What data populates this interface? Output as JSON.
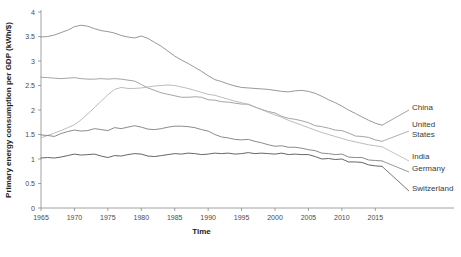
{
  "chart_data": {
    "type": "line",
    "title": "",
    "xlabel": "Time",
    "ylabel": "Primary energy consumption per GDP (kWh/$)",
    "xlim": [
      1965,
      2016
    ],
    "ylim": [
      0,
      4
    ],
    "grid": false,
    "legend_position": "right-inline-labels",
    "xticks": [
      "1965",
      "1970",
      "1975",
      "1980",
      "1985",
      "1990",
      "1995",
      "2000",
      "2005",
      "2010",
      "2015"
    ],
    "xtick_values": [
      1965,
      1970,
      1975,
      1980,
      1985,
      1990,
      1995,
      2000,
      2005,
      2010,
      2015
    ],
    "yticks": [
      "0",
      "0.5",
      "1",
      "1.5",
      "2",
      "2.5",
      "3",
      "3.5",
      "4"
    ],
    "ytick_values": [
      0,
      0.5,
      1,
      1.5,
      2,
      2.5,
      3,
      3.5,
      4
    ],
    "x": [
      1965,
      1966,
      1967,
      1968,
      1969,
      1970,
      1971,
      1972,
      1973,
      1974,
      1975,
      1976,
      1977,
      1978,
      1979,
      1980,
      1981,
      1982,
      1983,
      1984,
      1985,
      1986,
      1987,
      1988,
      1989,
      1990,
      1991,
      1992,
      1993,
      1994,
      1995,
      1996,
      1997,
      1998,
      1999,
      2000,
      2001,
      2002,
      2003,
      2004,
      2005,
      2006,
      2007,
      2008,
      2009,
      2010,
      2011,
      2012,
      2013,
      2014,
      2015,
      2016
    ],
    "series": [
      {
        "name": "China",
        "color": "#8c8c8c",
        "label_x": 2016,
        "values": [
          3.49,
          3.5,
          3.53,
          3.58,
          3.63,
          3.7,
          3.73,
          3.71,
          3.66,
          3.62,
          3.6,
          3.57,
          3.52,
          3.49,
          3.47,
          3.51,
          3.46,
          3.38,
          3.3,
          3.2,
          3.1,
          3.02,
          2.95,
          2.87,
          2.79,
          2.7,
          2.62,
          2.58,
          2.53,
          2.49,
          2.46,
          2.45,
          2.44,
          2.43,
          2.42,
          2.4,
          2.38,
          2.37,
          2.39,
          2.4,
          2.38,
          2.34,
          2.28,
          2.21,
          2.15,
          2.08,
          2.0,
          1.93,
          1.86,
          1.79,
          1.73,
          1.69
        ]
      },
      {
        "name": "United States",
        "color": "#9a9a9a",
        "label_x": 2016,
        "values": [
          2.67,
          2.66,
          2.65,
          2.64,
          2.65,
          2.66,
          2.64,
          2.63,
          2.63,
          2.64,
          2.63,
          2.64,
          2.63,
          2.61,
          2.59,
          2.52,
          2.45,
          2.4,
          2.35,
          2.32,
          2.29,
          2.26,
          2.26,
          2.27,
          2.26,
          2.21,
          2.2,
          2.17,
          2.16,
          2.14,
          2.12,
          2.12,
          2.06,
          2.01,
          1.97,
          1.94,
          1.87,
          1.83,
          1.81,
          1.78,
          1.74,
          1.68,
          1.66,
          1.63,
          1.59,
          1.58,
          1.53,
          1.47,
          1.46,
          1.44,
          1.39,
          1.36
        ]
      },
      {
        "name": "India",
        "color": "#b4b4b4",
        "label_x": 2016,
        "values": [
          1.43,
          1.48,
          1.53,
          1.58,
          1.64,
          1.7,
          1.8,
          1.92,
          2.05,
          2.18,
          2.31,
          2.42,
          2.46,
          2.44,
          2.44,
          2.45,
          2.47,
          2.49,
          2.5,
          2.51,
          2.5,
          2.47,
          2.44,
          2.4,
          2.36,
          2.32,
          2.3,
          2.26,
          2.22,
          2.18,
          2.15,
          2.11,
          2.06,
          2.01,
          1.95,
          1.9,
          1.85,
          1.79,
          1.74,
          1.69,
          1.64,
          1.59,
          1.54,
          1.5,
          1.46,
          1.42,
          1.38,
          1.35,
          1.32,
          1.29,
          1.27,
          1.25
        ]
      },
      {
        "name": "Germany",
        "color": "#7e7e7e",
        "label_x": 2016,
        "values": [
          1.49,
          1.48,
          1.46,
          1.52,
          1.56,
          1.59,
          1.57,
          1.58,
          1.62,
          1.6,
          1.58,
          1.64,
          1.62,
          1.65,
          1.68,
          1.65,
          1.61,
          1.6,
          1.62,
          1.65,
          1.67,
          1.67,
          1.66,
          1.64,
          1.6,
          1.57,
          1.5,
          1.45,
          1.43,
          1.4,
          1.39,
          1.4,
          1.36,
          1.33,
          1.29,
          1.26,
          1.27,
          1.24,
          1.24,
          1.22,
          1.19,
          1.17,
          1.12,
          1.11,
          1.09,
          1.1,
          1.04,
          1.03,
          1.03,
          0.98,
          0.97,
          0.96
        ]
      },
      {
        "name": "Switzerland",
        "color": "#555555",
        "label_x": 2016,
        "values": [
          1.02,
          1.03,
          1.02,
          1.04,
          1.07,
          1.1,
          1.08,
          1.09,
          1.1,
          1.06,
          1.03,
          1.07,
          1.06,
          1.09,
          1.11,
          1.1,
          1.06,
          1.05,
          1.07,
          1.09,
          1.11,
          1.1,
          1.12,
          1.11,
          1.09,
          1.1,
          1.12,
          1.11,
          1.12,
          1.1,
          1.11,
          1.13,
          1.11,
          1.12,
          1.11,
          1.1,
          1.12,
          1.09,
          1.1,
          1.09,
          1.09,
          1.05,
          1.0,
          1.01,
          0.99,
          1.0,
          0.94,
          0.94,
          0.93,
          0.88,
          0.86,
          0.85
        ]
      }
    ],
    "series_labels": [
      {
        "name": "China",
        "y_px": 110
      },
      {
        "name": "United States",
        "y_px": 131
      },
      {
        "name": "India",
        "y_px": 161
      },
      {
        "name": "Germany",
        "y_px": 172
      },
      {
        "name": "Switzerland",
        "y_px": 191
      }
    ]
  },
  "caption": {
    "text": ""
  }
}
